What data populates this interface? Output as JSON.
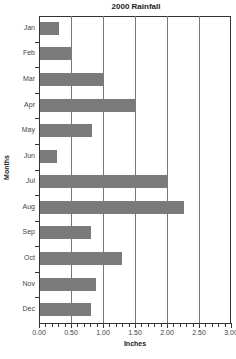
{
  "chart_data": {
    "type": "bar",
    "orientation": "horizontal",
    "title": "2000 Rainfall",
    "xlabel": "Inches",
    "ylabel": "Months",
    "categories": [
      "Jan",
      "Feb",
      "Mar",
      "Apr",
      "May",
      "Jun",
      "Jul",
      "Aug",
      "Sep",
      "Oct",
      "Nov",
      "Dec"
    ],
    "values": [
      0.3,
      0.5,
      1.0,
      1.5,
      0.81,
      0.27,
      2.0,
      2.25,
      0.8,
      1.28,
      0.88,
      0.79
    ],
    "xlim": [
      0,
      3.0
    ],
    "xticks": [
      "0.00",
      "0.50",
      "1.00",
      "1.50",
      "2.00",
      "2.50",
      "3.00"
    ],
    "grid": "vertical",
    "bar_color": "#7a7a7a"
  }
}
